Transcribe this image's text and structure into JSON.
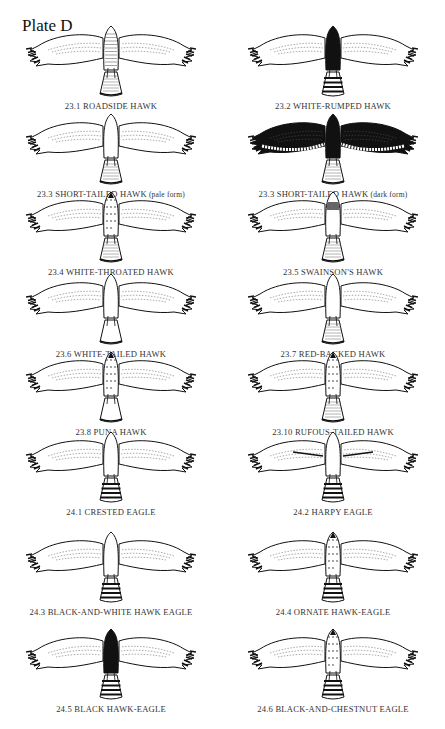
{
  "plate": {
    "title": "Plate D"
  },
  "birds": [
    {
      "label": "23.1 ROADSIDE HAWK",
      "body": "barred",
      "tail": "barred",
      "wing": "pale",
      "x": 0,
      "y": 22
    },
    {
      "label": "23.2 WHITE-RUMPED HAWK",
      "body": "dark",
      "tail": "banded",
      "wing": "pale",
      "x": 222,
      "y": 22
    },
    {
      "label": "23.3 SHORT-TAILED HAWK",
      "note": "(pale form)",
      "body": "white",
      "tail": "fine",
      "wing": "pale",
      "x": 0,
      "y": 110
    },
    {
      "label": "23.3 SHORT-TAILED HAWK",
      "note": "(dark form)",
      "body": "dark",
      "tail": "fine",
      "wing": "dark",
      "x": 222,
      "y": 110
    },
    {
      "label": "23.4 WHITE-THROATED HAWK",
      "body": "streaked",
      "tail": "fine",
      "wing": "pale",
      "x": 0,
      "y": 188
    },
    {
      "label": "23.5 SWAINSON'S HAWK",
      "body": "bib",
      "tail": "fine",
      "wing": "pale",
      "x": 222,
      "y": 188
    },
    {
      "label": "23.6 WHITE-TAILED HAWK",
      "body": "white",
      "tail": "white",
      "wing": "pale",
      "x": 0,
      "y": 270
    },
    {
      "label": "23.7 RED-BACKED HAWK",
      "body": "white",
      "tail": "fine",
      "wing": "pale",
      "x": 222,
      "y": 270
    },
    {
      "label": "23.8 PUNA HAWK",
      "body": "streaked",
      "tail": "white",
      "wing": "pale",
      "x": 0,
      "y": 348
    },
    {
      "label": "23.10 RUFOUS-TAILED HAWK",
      "body": "streaked",
      "tail": "fine",
      "wing": "pale",
      "x": 222,
      "y": 348
    },
    {
      "label": "24.1 CRESTED EAGLE",
      "body": "white",
      "tail": "banded",
      "wing": "pale",
      "x": 0,
      "y": 428
    },
    {
      "label": "24.2 HARPY EAGLE",
      "body": "white",
      "tail": "banded",
      "wing": "harpy",
      "x": 222,
      "y": 428
    },
    {
      "label": "24.3 BLACK-AND-WHITE HAWK EAGLE",
      "body": "white",
      "tail": "banded",
      "wing": "pale",
      "x": 0,
      "y": 528
    },
    {
      "label": "24.4 ORNATE HAWK-EAGLE",
      "body": "streaked",
      "tail": "banded",
      "wing": "pale",
      "x": 222,
      "y": 528
    },
    {
      "label": "24.5 BLACK HAWK-EAGLE",
      "body": "dark",
      "tail": "banded",
      "wing": "pale",
      "x": 0,
      "y": 625
    },
    {
      "label": "24.6 BLACK-AND-CHESTNUT EAGLE",
      "body": "streaked",
      "tail": "banded",
      "wing": "pale",
      "x": 222,
      "y": 625
    }
  ]
}
